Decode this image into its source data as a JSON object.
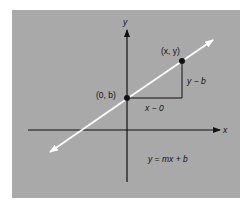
{
  "diagram": {
    "type": "coordinate-plane-line",
    "colors": {
      "background": "#a9a9a9",
      "page": "#ffffff",
      "axis": "#111111",
      "line": "#ffffff",
      "point": "#111111"
    },
    "axes": {
      "x_label": "x",
      "y_label": "y"
    },
    "points": [
      {
        "id": "intercept",
        "label": "(0, b)"
      },
      {
        "id": "general",
        "label": "(x, y)"
      }
    ],
    "legs": {
      "run_label": "x − 0",
      "rise_label": "y − b"
    },
    "equation": "y = mx + b"
  }
}
